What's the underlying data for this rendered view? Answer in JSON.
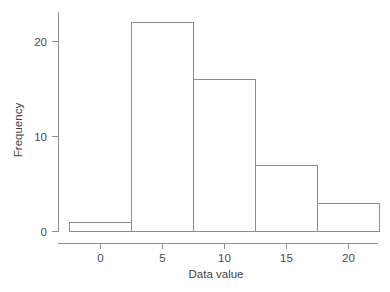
{
  "chart_data": {
    "type": "bar",
    "chart_subtype": "histogram",
    "title": "",
    "xlabel": "Data value",
    "ylabel": "Frequency",
    "categories": [
      "-2.5 to 2.5",
      "2.5 to 7.5",
      "7.5 to 12.5",
      "12.5 to 17.5",
      "17.5 to 22.5"
    ],
    "bin_edges": [
      -2.5,
      2.5,
      7.5,
      12.5,
      17.5,
      22.5
    ],
    "bin_width": 5,
    "values": [
      1,
      22,
      16,
      7,
      3
    ],
    "bins": [
      {
        "from": -2.5,
        "to": 2.5,
        "frequency": 1
      },
      {
        "from": 2.5,
        "to": 7.5,
        "frequency": 22
      },
      {
        "from": 7.5,
        "to": 12.5,
        "frequency": 16
      },
      {
        "from": 12.5,
        "to": 17.5,
        "frequency": 7
      },
      {
        "from": 17.5,
        "to": 22.5,
        "frequency": 3
      }
    ],
    "total_count": 49,
    "xlim": [
      -2.5,
      22.5
    ],
    "ylim": [
      0,
      22
    ],
    "xticks": [
      0,
      5,
      10,
      15,
      20
    ],
    "xtick_labels": [
      "0",
      "5",
      "10",
      "15",
      "20"
    ],
    "yticks": [
      0,
      10,
      20
    ],
    "ytick_labels": [
      "0",
      "10",
      "20"
    ],
    "grid": false,
    "legend": false,
    "legend_position": "none",
    "colors": {
      "bar_fill": "#ffffff",
      "bar_stroke": "#8c8c8c",
      "axis": "#8f8f8f",
      "text": "#4a4a4a",
      "background": "#ffffff"
    }
  },
  "axes": {
    "x": {
      "title": "Data value",
      "ticks": [
        {
          "label": "0",
          "value": 0
        },
        {
          "label": "5",
          "value": 5
        },
        {
          "label": "10",
          "value": 10
        },
        {
          "label": "15",
          "value": 15
        },
        {
          "label": "20",
          "value": 20
        }
      ]
    },
    "y": {
      "title": "Frequency",
      "ticks": [
        {
          "label": "0",
          "value": 0
        },
        {
          "label": "10",
          "value": 10
        },
        {
          "label": "20",
          "value": 20
        }
      ]
    }
  }
}
